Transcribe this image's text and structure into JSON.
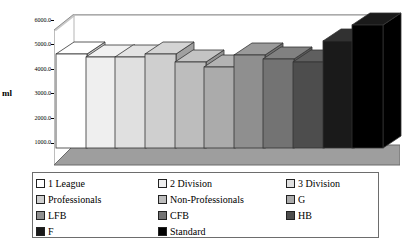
{
  "chart_data": {
    "type": "bar",
    "title": "",
    "xlabel": "",
    "ylabel": "ml",
    "ylim": [
      0,
      6000
    ],
    "yticks": [
      "1000.0",
      "2000.0",
      "3000.0",
      "4000.0",
      "5000.0",
      "6000.0"
    ],
    "grid": false,
    "legend_position": "bottom",
    "three_d": true,
    "categories": [
      "1 League",
      "2 Division",
      "3 Division",
      "Professionals",
      "Non-Professionals",
      "G",
      "LFB",
      "CFB",
      "HB",
      "F",
      "Standard"
    ],
    "values": [
      4500,
      4380,
      4380,
      4500,
      4130,
      3890,
      4460,
      4250,
      4130,
      5150,
      5920
    ],
    "colors": [
      "#ffffff",
      "#efefef",
      "#e0e0e0",
      "#cfcfcf",
      "#bdbdbd",
      "#ababab",
      "#8f8f8f",
      "#737373",
      "#4d4d4d",
      "#1a1a1a",
      "#000000"
    ]
  },
  "axis": {
    "y_label": "ml",
    "ticks": [
      {
        "label": "6000.0",
        "value": 6000
      },
      {
        "label": "5000.0",
        "value": 5000
      },
      {
        "label": "4000.0",
        "value": 4000
      },
      {
        "label": "3000.0",
        "value": 3000
      },
      {
        "label": "2000.0",
        "value": 2000
      },
      {
        "label": "1000.0",
        "value": 1000
      }
    ]
  },
  "legend": {
    "rows": [
      [
        {
          "label": "1 League",
          "color": "#ffffff"
        },
        {
          "label": "2 Division",
          "color": "#efefef"
        },
        {
          "label": "3 Division",
          "color": "#e0e0e0"
        }
      ],
      [
        {
          "label": "Professionals",
          "color": "#cfcfcf"
        },
        {
          "label": "Non-Professionals",
          "color": "#bdbdbd"
        },
        {
          "label": "G",
          "color": "#ababab"
        }
      ],
      [
        {
          "label": "LFB",
          "color": "#8f8f8f"
        },
        {
          "label": "CFB",
          "color": "#737373"
        },
        {
          "label": "HB",
          "color": "#4d4d4d"
        }
      ],
      [
        {
          "label": "F",
          "color": "#1a1a1a"
        },
        {
          "label": "Standard",
          "color": "#000000"
        }
      ]
    ]
  },
  "style": {
    "floor_color": "#9e9e9e",
    "floor_edge": "#6b6b6b",
    "wall_color": "#ffffff",
    "axis_color": "#7d7d7d"
  }
}
